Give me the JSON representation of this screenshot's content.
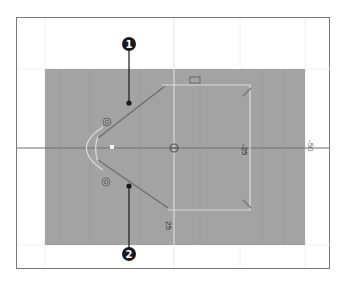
{
  "figure": {
    "callouts": [
      {
        "number": "1",
        "label_x": 129,
        "label_y": 45,
        "target_x": 129,
        "target_y": 103
      },
      {
        "number": "2",
        "label_x": 129,
        "label_y": 254,
        "target_x": 129,
        "target_y": 186
      }
    ],
    "axis_labels": {
      "x_neg25": "-25",
      "x_neg50": "-50",
      "y_pos25": "25"
    },
    "colors": {
      "canvas": "#a3a3a3",
      "guide_line": "#e6e6e6",
      "shape_line": "#dcdcdc",
      "tangent_line": "#6f6f6f",
      "callout": "#1a1a1a",
      "frame_border": "#7a7a7a"
    }
  }
}
